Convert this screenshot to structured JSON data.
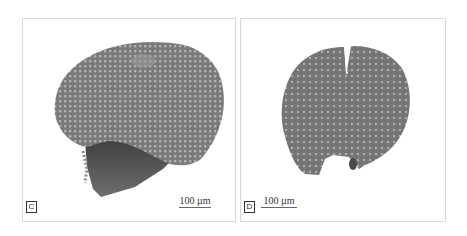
{
  "figure": {
    "panels": [
      {
        "id": "C",
        "label": "C",
        "scale_bar_text": "100 µm",
        "description": "Large rounded specimen with dense regular pitted/reticulate surface and darker basal fragment"
      },
      {
        "id": "D",
        "label": "D",
        "scale_bar_text": "100 µm",
        "description": "Rounded specimen with vertical slit at top and notch at bottom, pitted surface"
      }
    ],
    "colors": {
      "background": "#ffffff",
      "panel_border": "#d8d8d8",
      "specimen_gray": "#7a7a7a",
      "specimen_dark": "#4a4a4a",
      "pit_light": "#b8b8b8",
      "label_border": "#333333"
    }
  }
}
